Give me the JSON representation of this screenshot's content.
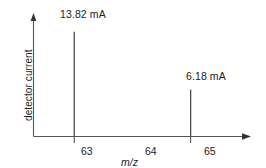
{
  "chart_data": {
    "type": "bar",
    "title": "",
    "subtitle": "",
    "xlabel": "m/z",
    "ylabel": "detector current",
    "categories": [
      "63",
      "65"
    ],
    "values": [
      13.82,
      6.18
    ],
    "value_unit": "mA",
    "data_labels": [
      "13.82 mA",
      "6.18 mA"
    ],
    "x": [
      63,
      65
    ],
    "xlim": [
      62.3,
      65.9
    ],
    "ylim": [
      0,
      15.1
    ],
    "xticks": [
      63,
      64,
      65
    ],
    "xtick_labels": [
      "63",
      "64",
      "65"
    ],
    "xticks_with_marks": [
      63,
      65
    ],
    "yticks": [],
    "ytick_labels": [],
    "grid": false,
    "legend": null,
    "legend_position": "none",
    "axis_arrows": true,
    "annotations": [
      {
        "text": "13.82 mA",
        "x": 63,
        "y": 13.82
      },
      {
        "text": "6.18 mA",
        "x": 65,
        "y": 6.18
      }
    ],
    "series": [
      {
        "name": "detector current",
        "values": [
          13.82,
          6.18
        ]
      }
    ],
    "colors": {
      "axis": "#555555",
      "peak": "#4a4a4a",
      "text": "#1d1d1d",
      "background": "#ffffff"
    }
  },
  "labels": {
    "peak_1": "13.82 mA",
    "peak_2": "6.18 mA",
    "tick_63": "63",
    "tick_64": "64",
    "tick_65": "65",
    "x_axis_title": "m/z",
    "y_axis_title": "detector current"
  }
}
